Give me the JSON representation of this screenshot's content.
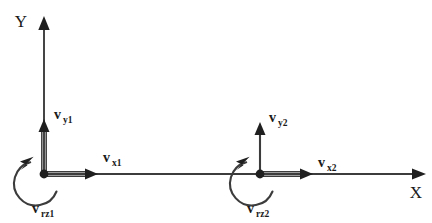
{
  "figure": {
    "background_color": "#ffffff",
    "ink_color": "#3c3c3c",
    "width": 432,
    "height": 223
  },
  "axes": {
    "x_label": "X",
    "y_label": "Y",
    "origin_x": 44,
    "origin_y": 174,
    "x_axis_end": 420,
    "y_axis_top": 18
  },
  "nodes": [
    {
      "id": "node-1",
      "x": 44,
      "y": 174,
      "vx": {
        "name": "v-x1",
        "base": "v",
        "subscript": "x1",
        "label": "vx1",
        "direction": "right",
        "length": 48,
        "label_x": 103,
        "label_y": 162
      },
      "vy": {
        "name": "v-y1",
        "base": "v",
        "subscript": "y1",
        "label": "vy1",
        "direction": "up",
        "length": 53,
        "label_x": 55,
        "label_y": 119
      },
      "vrz": {
        "name": "v-rz1",
        "base": "v",
        "subscript": "rz1",
        "label": "vrz1",
        "direction": "counterclockwise",
        "radius": 22,
        "label_x": 32,
        "label_y": 213
      }
    },
    {
      "id": "node-2",
      "x": 260,
      "y": 174,
      "vx": {
        "name": "v-x2",
        "base": "v",
        "subscript": "x2",
        "label": "vx2",
        "direction": "right",
        "length": 48,
        "label_x": 318,
        "label_y": 167
      },
      "vy": {
        "name": "v-y2",
        "base": "v",
        "subscript": "y2",
        "label": "vy2",
        "direction": "up",
        "length": 53,
        "label_x": 270,
        "label_y": 122
      },
      "vrz": {
        "name": "v-rz2",
        "base": "v",
        "subscript": "rz2",
        "label": "vrz2",
        "direction": "counterclockwise",
        "radius": 22,
        "label_x": 247,
        "label_y": 213
      }
    }
  ]
}
